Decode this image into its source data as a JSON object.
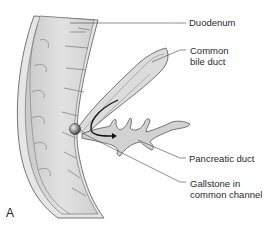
{
  "figure": {
    "panel": "A",
    "labels": {
      "duodenum": "Duodenum",
      "common_bile_duct_line1": "Common",
      "common_bile_duct_line2": "bile duct",
      "pancreatic_duct": "Pancreatic duct",
      "gallstone_line1": "Gallstone in",
      "gallstone_line2": "common channel"
    },
    "colors": {
      "tissue_fill": "#d9d9d9",
      "tissue_light": "#ececec",
      "outline": "#555555",
      "leader_line": "#444444",
      "flow_arrow": "#111111",
      "stone": "#8a8a8a"
    }
  }
}
